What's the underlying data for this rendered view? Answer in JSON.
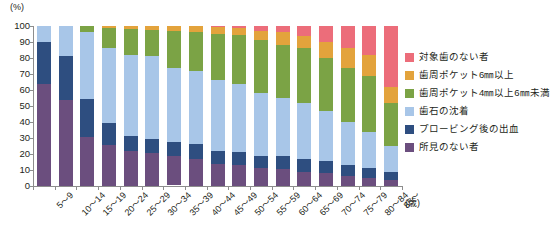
{
  "axis": {
    "y_unit": "(%)",
    "x_unit": "(歳)",
    "y_ticks": [
      "100",
      "90",
      "80",
      "70",
      "60",
      "50",
      "40",
      "30",
      "20",
      "10",
      "0"
    ]
  },
  "legend": {
    "items": [
      {
        "label": "対象歯のない者",
        "color": "#ec6d7a",
        "key": "no_target_teeth"
      },
      {
        "label": "歯周ポケット6㎜以上",
        "color": "#e3a33c",
        "key": "pocket_6mm_plus"
      },
      {
        "label": "歯周ポケット4㎜以上6㎜未満",
        "color": "#7ba345",
        "key": "pocket_4_to_6mm"
      },
      {
        "label": "歯石の沈着",
        "color": "#a8c6e8",
        "key": "calculus"
      },
      {
        "label": "プロービング後の出血",
        "color": "#2e4e80",
        "key": "bleeding_on_probing"
      },
      {
        "label": "所見のない者",
        "color": "#6b4e7e",
        "key": "no_findings"
      }
    ]
  },
  "chart_data": {
    "type": "bar",
    "stacked": true,
    "title": "",
    "xlabel": "(歳)",
    "ylabel": "(%)",
    "ylim": [
      0,
      100
    ],
    "grid": false,
    "legend_position": "right",
    "categories": [
      "5～9",
      "10～14",
      "15～19",
      "20～24",
      "25～29",
      "30～34",
      "35～39",
      "40～44",
      "45～49",
      "50～54",
      "55～59",
      "60～64",
      "65～69",
      "70～74",
      "75～79",
      "80～84",
      "85～"
    ],
    "series": [
      {
        "name": "所見のない者",
        "color": "#6b4e7e",
        "values": [
          64.0,
          54.0,
          30.5,
          25.5,
          22.0,
          20.5,
          18.0,
          17.0,
          14.0,
          13.0,
          11.0,
          10.5,
          9.0,
          8.0,
          6.0,
          5.0,
          3.5
        ]
      },
      {
        "name": "プロービング後の出血",
        "color": "#2e4e80",
        "values": [
          26.0,
          27.5,
          24.0,
          14.0,
          9.0,
          9.0,
          9.0,
          9.0,
          8.0,
          8.0,
          8.0,
          8.0,
          8.0,
          7.5,
          7.0,
          6.0,
          5.0
        ]
      },
      {
        "name": "歯石の沈着",
        "color": "#a8c6e8",
        "values": [
          10.0,
          18.5,
          41.5,
          47.0,
          51.0,
          51.5,
          46.5,
          46.0,
          44.0,
          43.0,
          39.0,
          36.5,
          35.0,
          31.5,
          27.0,
          23.0,
          16.5
        ]
      },
      {
        "name": "歯周ポケット4㎜以上6㎜未満",
        "color": "#7ba345",
        "values": [
          0.0,
          0.0,
          4.0,
          12.5,
          16.0,
          16.5,
          23.0,
          24.0,
          29.0,
          30.5,
          33.0,
          33.0,
          34.0,
          33.0,
          34.0,
          35.0,
          27.0
        ]
      },
      {
        "name": "歯周ポケット6㎜以上",
        "color": "#e3a33c",
        "values": [
          0.0,
          0.0,
          0.0,
          1.0,
          2.0,
          2.5,
          3.0,
          4.0,
          4.5,
          4.5,
          6.0,
          8.0,
          8.0,
          10.0,
          12.0,
          13.0,
          10.0
        ]
      },
      {
        "name": "対象歯のない者",
        "color": "#ec6d7a",
        "values": [
          0.0,
          0.0,
          0.0,
          0.0,
          0.0,
          0.0,
          0.0,
          0.0,
          0.5,
          1.0,
          3.0,
          4.0,
          6.0,
          10.0,
          14.0,
          18.0,
          38.0
        ]
      }
    ]
  }
}
